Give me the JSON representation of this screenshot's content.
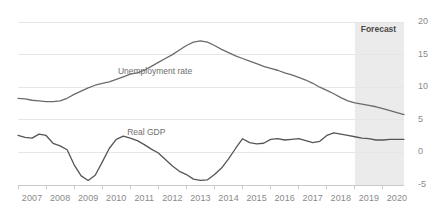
{
  "chart_data": {
    "type": "line",
    "title": "",
    "subtitle": "",
    "xlabel": "",
    "ylabel": "",
    "xlim": [
      2007.0,
      2020.75
    ],
    "ylim": [
      -5,
      20
    ],
    "y_ticks": [
      20,
      15,
      10,
      5,
      0,
      -5
    ],
    "x_ticks": [
      "2007",
      "2008",
      "2009",
      "2010",
      "2011",
      "2012",
      "2013",
      "2014",
      "2015",
      "2016",
      "2017",
      "2018",
      "2019",
      "2020"
    ],
    "grid": "horizontal",
    "legend_position": "inline-annotation",
    "frequency": "quarterly",
    "x": [
      2007.0,
      2007.25,
      2007.5,
      2007.75,
      2008.0,
      2008.25,
      2008.5,
      2008.75,
      2009.0,
      2009.25,
      2009.5,
      2009.75,
      2010.0,
      2010.25,
      2010.5,
      2010.75,
      2011.0,
      2011.25,
      2011.5,
      2011.75,
      2012.0,
      2012.25,
      2012.5,
      2012.75,
      2013.0,
      2013.25,
      2013.5,
      2013.75,
      2014.0,
      2014.25,
      2014.5,
      2014.75,
      2015.0,
      2015.25,
      2015.5,
      2015.75,
      2016.0,
      2016.25,
      2016.5,
      2016.75,
      2017.0,
      2017.25,
      2017.5,
      2017.75,
      2018.0,
      2018.25,
      2018.5,
      2018.75,
      2019.0,
      2019.25,
      2019.5,
      2019.75,
      2020.0,
      2020.25,
      2020.5,
      2020.75
    ],
    "series": [
      {
        "name": "Unemployment rate",
        "color": "#6b6b6b",
        "label_x": 2011.7,
        "label_y": 12.4,
        "values": [
          8.3,
          8.2,
          8.0,
          7.9,
          7.8,
          7.8,
          7.9,
          8.3,
          8.9,
          9.4,
          9.9,
          10.3,
          10.6,
          10.8,
          11.2,
          11.6,
          12.0,
          12.2,
          12.6,
          13.2,
          13.8,
          14.4,
          15.0,
          15.7,
          16.4,
          16.9,
          17.1,
          16.9,
          16.4,
          15.8,
          15.3,
          14.8,
          14.4,
          14.0,
          13.6,
          13.2,
          12.9,
          12.6,
          12.2,
          11.9,
          11.5,
          11.1,
          10.6,
          10.0,
          9.5,
          9.0,
          8.4,
          7.9,
          7.6,
          7.4,
          7.2,
          7.0,
          6.7,
          6.4,
          6.1,
          5.8
        ]
      },
      {
        "name": "Real GDP",
        "color": "#555555",
        "label_x": 2011.6,
        "label_y": 3.0,
        "values": [
          2.6,
          2.3,
          2.2,
          2.8,
          2.6,
          1.4,
          1.0,
          0.4,
          -1.9,
          -3.6,
          -4.3,
          -3.5,
          -1.5,
          0.6,
          2.0,
          2.5,
          2.2,
          1.8,
          1.2,
          0.5,
          -0.1,
          -1.1,
          -2.1,
          -2.9,
          -3.4,
          -4.1,
          -4.3,
          -4.2,
          -3.4,
          -2.4,
          -1.0,
          0.6,
          2.1,
          1.5,
          1.3,
          1.4,
          2.0,
          2.1,
          1.9,
          2.0,
          2.1,
          1.8,
          1.5,
          1.7,
          2.6,
          3.0,
          2.8,
          2.6,
          2.4,
          2.2,
          2.1,
          1.9,
          1.9,
          2.0,
          2.0,
          2.0
        ]
      }
    ],
    "shaded_regions": [
      {
        "label": "Forecast",
        "x_start": 2019.0,
        "x_end": 2020.75,
        "color": "#ebebeb",
        "label_x": 2019.85,
        "label_y": 18.7
      }
    ],
    "axis_color": "#c9c9c9",
    "grid_color": "#e6e6e6",
    "tick_label_color": "#8a8a8a"
  }
}
